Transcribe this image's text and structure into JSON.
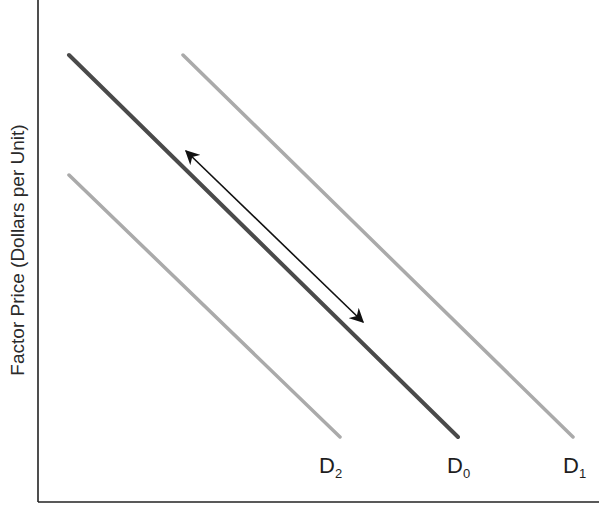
{
  "diagram": {
    "title": "",
    "y_axis_label": "Factor Price (Dollars per Unit)",
    "x_axis_label": "",
    "colors": {
      "axis": "#222222",
      "d0_curve": "#4a4a4a",
      "shifted_curves": "#aaaaaa",
      "arrow": "#111111"
    },
    "curves": [
      {
        "id": "D0",
        "letter": "D",
        "subscript": "0",
        "style": "dark",
        "start": [
          69,
          55
        ],
        "end": [
          458,
          437
        ]
      },
      {
        "id": "D1",
        "letter": "D",
        "subscript": "1",
        "style": "light",
        "start": [
          183,
          55
        ],
        "end": [
          573,
          437
        ]
      },
      {
        "id": "D2",
        "letter": "D",
        "subscript": "2",
        "style": "light",
        "start": [
          69,
          175
        ],
        "end": [
          340,
          437
        ]
      }
    ],
    "movement_arrow": {
      "description": "double-headed arrow parallel to D0 indicating movement along the demand curve",
      "start": [
        183,
        148
      ],
      "end": [
        366,
        325
      ]
    }
  }
}
